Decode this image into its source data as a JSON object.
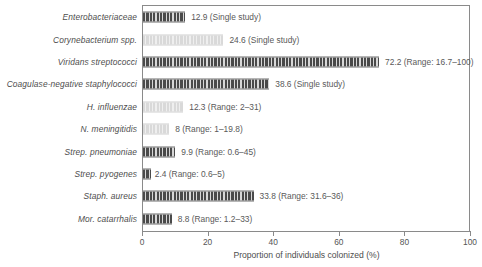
{
  "chart_data": {
    "type": "bar",
    "orientation": "horizontal",
    "title": "",
    "xlabel": "Proportion of individuals colonized (%)",
    "ylabel": "",
    "xlim": [
      0,
      100
    ],
    "xticks": [
      0,
      20,
      40,
      60,
      80,
      100
    ],
    "xtick_labels": [
      "0",
      "20",
      "40",
      "60",
      "80",
      "100"
    ],
    "grid": false,
    "legend": "none",
    "categories": [
      "Enterobacteriaceae",
      "Corynebacterium spp.",
      "Viridans streptococci",
      "Coagulase-negative staphylococci",
      "H. influenzae",
      "N. meningitidis",
      "Strep. pneumoniae",
      "Strep. pyogenes",
      "Staph. aureus",
      "Mor. catarrhalis"
    ],
    "values": [
      12.9,
      24.6,
      72.2,
      38.6,
      12.3,
      8,
      9.9,
      2.4,
      33.8,
      8.8
    ],
    "annotations": [
      "12.9 (Single study)",
      "24.6 (Single study)",
      "72.2 (Range: 16.7–100)",
      "38.6 (Single study)",
      "12.3 (Range: 2–31)",
      "8 (Range: 1–19.8)",
      "9.9 (Range: 0.6–45)",
      "2.4 (Range: 0.6–5)",
      "33.8 (Range: 31.6–36)",
      "8.8 (Range: 1.2–33)"
    ],
    "bar_styles": [
      "dark",
      "light",
      "dark",
      "dark",
      "light",
      "light",
      "dark",
      "dark",
      "dark",
      "dark"
    ]
  },
  "rows": [
    {
      "label": "Enterobacteriaceae",
      "value": 12.9,
      "annotation": "12.9 (Single study)",
      "style": "dark"
    },
    {
      "label": "Corynebacterium spp.",
      "value": 24.6,
      "annotation": "24.6 (Single study)",
      "style": "light"
    },
    {
      "label": "Viridans streptococci",
      "value": 72.2,
      "annotation": "72.2 (Range: 16.7–100)",
      "style": "dark"
    },
    {
      "label": "Coagulase-negative staphylococci",
      "value": 38.6,
      "annotation": "38.6 (Single study)",
      "style": "dark"
    },
    {
      "label": "H. influenzae",
      "value": 12.3,
      "annotation": "12.3 (Range: 2–31)",
      "style": "light"
    },
    {
      "label": "N. meningitidis",
      "value": 8,
      "annotation": "8 (Range: 1–19.8)",
      "style": "light"
    },
    {
      "label": "Strep. pneumoniae",
      "value": 9.9,
      "annotation": "9.9 (Range: 0.6–45)",
      "style": "dark"
    },
    {
      "label": "Strep. pyogenes",
      "value": 2.4,
      "annotation": "2.4 (Range: 0.6–5)",
      "style": "dark"
    },
    {
      "label": "Staph. aureus",
      "value": 33.8,
      "annotation": "33.8 (Range: 31.6–36)",
      "style": "dark"
    },
    {
      "label": "Mor. catarrhalis",
      "value": 8.8,
      "annotation": "8.8 (Range: 1.2–33)",
      "style": "dark"
    }
  ],
  "axis": {
    "title": "Proportion of individuals colonized (%)",
    "ticks": [
      "0",
      "20",
      "40",
      "60",
      "80",
      "100"
    ]
  },
  "colors": {
    "bar_dark": "#4a4a4a",
    "bar_light": "#d9d9d9",
    "frame": "#8a8a8a",
    "text": "#555555",
    "background": "#ffffff"
  }
}
